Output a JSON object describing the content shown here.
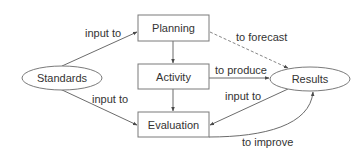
{
  "diagram": {
    "nodes": {
      "planning": {
        "label": "Planning",
        "shape": "rectangle"
      },
      "activity": {
        "label": "Activity",
        "shape": "rectangle"
      },
      "evaluation": {
        "label": "Evaluation",
        "shape": "rectangle"
      },
      "standards": {
        "label": "Standards",
        "shape": "ellipse"
      },
      "results": {
        "label": "Results",
        "shape": "ellipse"
      }
    },
    "edges": {
      "standards_planning": {
        "from": "Standards",
        "to": "Planning",
        "label": "input to",
        "style": "solid"
      },
      "standards_evaluation": {
        "from": "Standards",
        "to": "Evaluation",
        "label": "input to",
        "style": "solid"
      },
      "planning_results": {
        "from": "Planning",
        "to": "Results",
        "label": "to forecast",
        "style": "dashed"
      },
      "activity_results": {
        "from": "Activity",
        "to": "Results",
        "label": "to produce",
        "style": "solid"
      },
      "results_evaluation": {
        "from": "Results",
        "to": "Evaluation",
        "label": "input to",
        "style": "solid"
      },
      "evaluation_results": {
        "from": "Evaluation",
        "to": "Results",
        "label": "to improve",
        "style": "solid"
      },
      "planning_activity": {
        "from": "Planning",
        "to": "Activity",
        "label": "",
        "style": "solid"
      },
      "activity_evaluation": {
        "from": "Activity",
        "to": "Evaluation",
        "label": "",
        "style": "solid"
      }
    },
    "colors": {
      "stroke": "#7a7a7a",
      "text": "#333333",
      "background": "#ffffff"
    }
  }
}
